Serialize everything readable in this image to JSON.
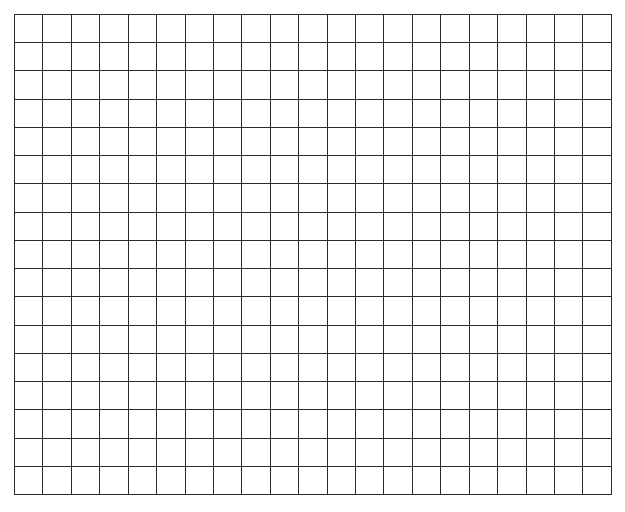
{
  "page": {
    "background_color": "#ffffff"
  },
  "clipped_caption": {
    "text": "..............",
    "color": "#b9b9c2",
    "note": "text clipped by top edge of screenshot, illegible"
  },
  "grid": {
    "name": "blank-grid",
    "columns": 21,
    "rows": 17,
    "cell_width_px": 28.5,
    "cell_height_px": 28.3,
    "line_color": "#2b2b2b",
    "line_width_px": 1.5,
    "cell_fill_color": "#ffffff",
    "left_px": 14,
    "top_px": 14,
    "width_px": 598,
    "height_px": 481,
    "cells_empty": true,
    "cell_values": []
  }
}
